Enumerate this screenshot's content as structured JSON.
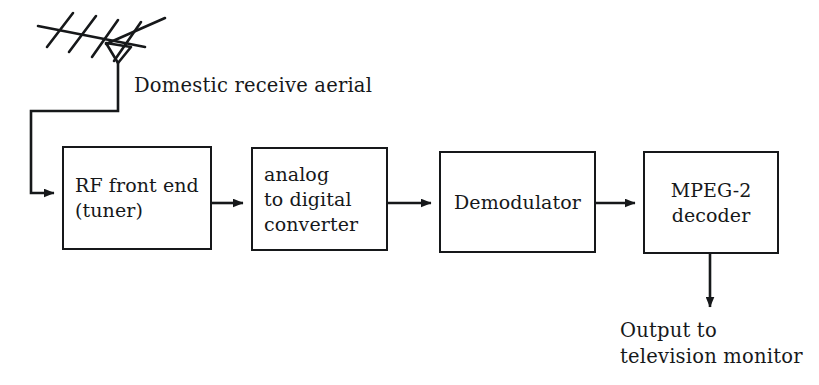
{
  "diagram": {
    "stroke_color": "#16181a",
    "background_color": "#ffffff",
    "blocks": [
      {
        "id": "rf-front-end",
        "name": "RF front end (tuner)",
        "lines": [
          "RF front end",
          "(tuner)"
        ],
        "align": "left"
      },
      {
        "id": "analog-to-digital-converter",
        "name": "analog to digital converter",
        "lines": [
          "analog",
          "to digital",
          "converter"
        ],
        "align": "left"
      },
      {
        "id": "demodulator",
        "name": "Demodulator",
        "lines": [
          "Demodulator"
        ],
        "align": "center"
      },
      {
        "id": "mpeg-2-decoder",
        "name": "MPEG-2 decoder",
        "lines": [
          "MPEG-2",
          "decoder"
        ],
        "align": "center"
      }
    ],
    "captions": {
      "aerial": "Domestic receive aerial",
      "output_line1": "Output to",
      "output_line2": "television monitor"
    },
    "icons": {
      "aerial": "tv-antenna-icon"
    }
  }
}
